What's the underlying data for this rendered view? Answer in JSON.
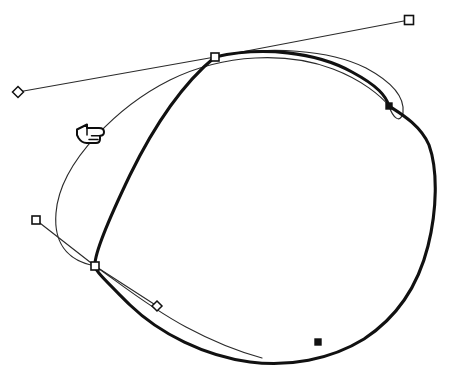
{
  "canvas": {
    "width": 449,
    "height": 367,
    "background_color": "#ffffff",
    "title": "Bezier path editing canvas"
  },
  "style": {
    "stroke_color": "#111111",
    "thin_stroke_color": "#2b2b2b",
    "handle_fill": "#ffffff",
    "thick_stroke_width": 3.1,
    "thin_stroke_width": 1.15
  },
  "paths": [
    {
      "name": "edited-thick-outline",
      "role": "edited closed bezier outline",
      "stroke_weight": "thick",
      "closed": true,
      "d": "M 215 57 C 262 46 316 52 352 72 C 378 86 386 96 389 106 C 398 112 420 124 429 145 C 438 170 437 210 428 246 C 418 286 396 318 364 339 C 330 360 288 367 250 362 C 205 356 160 334 130 305 C 106 281 96 272 95 266 C 94 256 106 225 130 175 C 152 130 180 86 215 57 Z"
    },
    {
      "name": "original-thin-outline",
      "role": "original thin reference curve",
      "stroke_weight": "thin",
      "closed": false,
      "d": "M 215 57 C 268 45 330 50 366 68 C 392 82 405 97 403 113 C 400 124 393 118 389 106 C 381 96 362 80 333 69 C 288 52 225 53 170 80 C 122 104 60 160 56 213 C 53 249 74 262 95 266"
    },
    {
      "name": "original-thin-lower-arc",
      "role": "original thin lower reference curve",
      "stroke_weight": "thin",
      "closed": false,
      "d": "M 95 266 C 118 282 150 308 186 327 C 214 342 240 352 262 358"
    }
  ],
  "tangent_lines": [
    {
      "name": "tangent-upper-left",
      "from_anchor": "anchor-top",
      "to_handle": "handle-diamond-left",
      "x1": 215,
      "y1": 57,
      "x2": 18,
      "y2": 92
    },
    {
      "name": "tangent-upper-right",
      "from_anchor": "anchor-top",
      "to_handle": "handle-square-top-right",
      "x1": 215,
      "y1": 57,
      "x2": 409,
      "y2": 20
    },
    {
      "name": "tangent-lower-upper",
      "from_anchor": "anchor-lower-left",
      "to_handle": "handle-square-left",
      "x1": 95,
      "y1": 266,
      "x2": 36,
      "y2": 220
    },
    {
      "name": "tangent-lower-lower",
      "from_anchor": "anchor-lower-left",
      "to_handle": "handle-diamond-lower",
      "x1": 95,
      "y1": 266,
      "x2": 157,
      "y2": 306
    }
  ],
  "anchor_points": [
    {
      "name": "anchor-top",
      "shape": "square-hollow",
      "x": 215,
      "y": 57,
      "size": 8,
      "selected": true
    },
    {
      "name": "anchor-lower-left",
      "shape": "square-hollow",
      "x": 95,
      "y": 266,
      "size": 8,
      "selected": true
    },
    {
      "name": "anchor-right",
      "shape": "square-solid",
      "x": 389,
      "y": 106,
      "size": 6,
      "selected": false
    },
    {
      "name": "anchor-bottom",
      "shape": "square-solid",
      "x": 318,
      "y": 342,
      "size": 6,
      "selected": false
    }
  ],
  "control_handles": [
    {
      "name": "handle-square-top-right",
      "shape": "square-hollow",
      "x": 409,
      "y": 20,
      "size": 9
    },
    {
      "name": "handle-diamond-left",
      "shape": "diamond-hollow",
      "x": 18,
      "y": 92,
      "size": 11
    },
    {
      "name": "handle-square-left",
      "shape": "square-hollow",
      "x": 36,
      "y": 220,
      "size": 8
    },
    {
      "name": "handle-diamond-lower",
      "shape": "diamond-hollow",
      "x": 157,
      "y": 306,
      "size": 10
    }
  ],
  "cursor": {
    "name": "pointing-hand-cursor",
    "icon": "hand-pointing-left-icon",
    "x": 75,
    "y": 120,
    "width": 30,
    "height": 28,
    "direction": "left"
  }
}
